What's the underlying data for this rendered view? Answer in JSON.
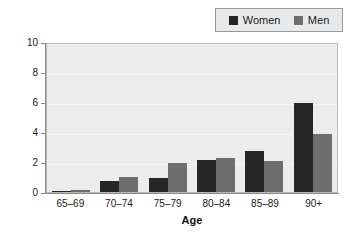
{
  "chart_data": {
    "type": "bar",
    "title": "",
    "xlabel": "Age",
    "ylabel": "Per 100",
    "ylabel_rendered": "Per 100",
    "categories": [
      "65–69",
      "70–74",
      "75–79",
      "80–84",
      "85–89",
      "90+"
    ],
    "series": [
      {
        "name": "Women",
        "color": "#262626",
        "values": [
          0.1,
          0.75,
          0.95,
          2.15,
          2.75,
          5.95
        ]
      },
      {
        "name": "Men",
        "color": "#6e6e6e",
        "values": [
          0.15,
          1.0,
          1.95,
          2.25,
          2.05,
          3.9
        ]
      }
    ],
    "ylim": [
      0,
      10
    ],
    "yticks": [
      0,
      2,
      4,
      6,
      8,
      10
    ],
    "ytick_labels": [
      "0",
      "2",
      "4",
      "6",
      "8",
      "10"
    ],
    "grid": true,
    "legend_position": "top-right",
    "plot_background": "#ececec",
    "page_background": "#ffffff",
    "axis_color": "#8a8a8a",
    "gridline_color": "#f5f5f5"
  },
  "legend": {
    "items": [
      {
        "label": "Women",
        "swatch": "women-swatch-icon"
      },
      {
        "label": "Men",
        "swatch": "men-swatch-icon"
      }
    ]
  }
}
